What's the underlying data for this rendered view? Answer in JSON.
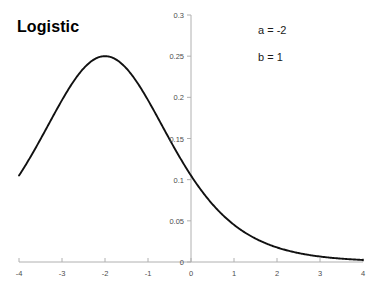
{
  "chart_data": {
    "type": "line",
    "title": "Logistic",
    "xlabel": "",
    "ylabel": "",
    "xlim": [
      -4,
      4
    ],
    "ylim": [
      0,
      0.3
    ],
    "grid": false,
    "legend": null,
    "xticks": [
      -4,
      -3,
      -2,
      -1,
      0,
      1,
      2,
      3,
      4
    ],
    "xtick_labels": [
      "-4",
      "-3",
      "-2",
      "-1",
      "0",
      "1",
      "2",
      "3",
      "4"
    ],
    "yticks": [
      0,
      0.05,
      0.1,
      0.15,
      0.2,
      0.25,
      0.3
    ],
    "ytick_labels": [
      "0",
      "0.05",
      "0.1",
      "0.15",
      "0.2",
      "0.25",
      "0.3"
    ],
    "annotations": [
      {
        "name": "parameter-a",
        "text": "a = -2"
      },
      {
        "name": "parameter-b",
        "text": "b = 1"
      }
    ],
    "series": [
      {
        "name": "logistic-pdf",
        "color": "#111111",
        "parameters": {
          "a": -2,
          "b": 1
        },
        "x": [
          -4,
          -3.75,
          -3.5,
          -3.25,
          -3,
          -2.75,
          -2.5,
          -2.25,
          -2,
          -1.75,
          -1.5,
          -1.25,
          -1,
          -0.75,
          -0.5,
          -0.25,
          0,
          0.25,
          0.5,
          0.75,
          1,
          1.25,
          1.5,
          1.75,
          2,
          2.25,
          2.5,
          2.75,
          3,
          3.25,
          3.5,
          3.75,
          4
        ],
        "values": [
          0.105,
          0.1217,
          0.1393,
          0.1572,
          0.175,
          0.1919,
          0.2076,
          0.2211,
          0.25,
          0.2211,
          0.2076,
          0.1919,
          0.175,
          0.1572,
          0.1393,
          0.1217,
          0.105,
          0.0895,
          0.0754,
          0.0629,
          0.052,
          0.0426,
          0.0347,
          0.0281,
          0.0226,
          0.0181,
          0.0144,
          0.0115,
          0.0091,
          0.0072,
          0.0057,
          0.0045,
          0.0035
        ]
      }
    ],
    "axis_color": "#b0b0b0",
    "curve_color": "#111111",
    "background": "#ffffff"
  },
  "labels": {
    "title": "Logistic",
    "a": "a = -2",
    "b": "b = 1"
  }
}
